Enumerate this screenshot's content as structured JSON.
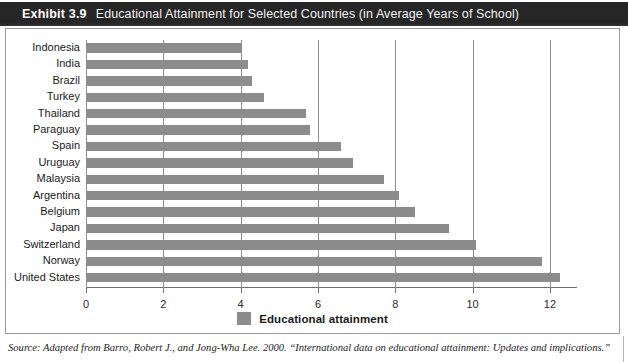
{
  "header": {
    "exhibit_number": "Exhibit 3.9",
    "title": "Educational Attainment for Selected Countries (in Average Years of School)"
  },
  "legend": {
    "label": "Educational attainment",
    "swatch_name": "legend-color-swatch",
    "color": "#8c8c8c",
    "position": "bottom-center"
  },
  "source": {
    "text": "Source: Adapted from Barro, Robert J., and Jong-Wha Lee. 2000. “International data on educational attainment: Updates and implications.” Working"
  },
  "colors": {
    "bar": "#8c8c8c",
    "header_background": "#262626",
    "header_text": "#ffffff",
    "gridline": "#8e8e8e",
    "frame_border": "#9a9a9a"
  },
  "chart_data": {
    "type": "bar",
    "orientation": "horizontal",
    "title": "Educational Attainment for Selected Countries (in Average Years of School)",
    "xlabel": "",
    "ylabel": "",
    "xlim": [
      0,
      12.7
    ],
    "xticks": [
      0,
      2,
      4,
      6,
      8,
      10,
      12
    ],
    "xtick_labels": [
      "0",
      "2",
      "4",
      "6",
      "8",
      "10",
      "12"
    ],
    "grid": "vertical",
    "legend_entries": [
      "Educational attainment"
    ],
    "categories": [
      "Indonesia",
      "India",
      "Brazil",
      "Turkey",
      "Thailand",
      "Paraguay",
      "Spain",
      "Uruguay",
      "Malaysia",
      "Argentina",
      "Belgium",
      "Japan",
      "Switzerland",
      "Norway",
      "United States"
    ],
    "values": [
      4.0,
      4.2,
      4.3,
      4.6,
      5.7,
      5.8,
      6.6,
      6.9,
      7.7,
      8.1,
      8.5,
      9.4,
      10.1,
      11.8,
      12.25
    ],
    "series": [
      {
        "name": "Educational attainment",
        "values": [
          4.0,
          4.2,
          4.3,
          4.6,
          5.7,
          5.8,
          6.6,
          6.9,
          7.7,
          8.1,
          8.5,
          9.4,
          10.1,
          11.8,
          12.25
        ]
      }
    ]
  }
}
